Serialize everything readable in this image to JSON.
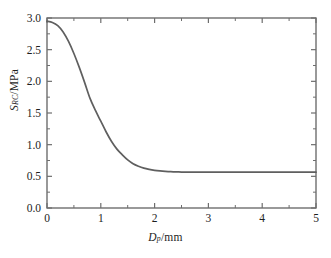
{
  "chart_data": {
    "type": "line",
    "title": "",
    "subtitle": "",
    "xlabel_symbol": "D",
    "xlabel_subscript": "p",
    "xlabel_unit": "/mm",
    "xlabel_full": "Dp/mm",
    "ylabel_symbol": "S",
    "ylabel_subscript": "RC",
    "ylabel_unit": "/MPa",
    "ylabel_full": "SRC/MPa",
    "xlim": [
      0,
      5
    ],
    "ylim": [
      0.0,
      3.0
    ],
    "xticks": [
      0,
      1,
      2,
      3,
      4,
      5
    ],
    "xtick_labels": [
      "0",
      "1",
      "2",
      "3",
      "4",
      "5"
    ],
    "xminor_ticks": [
      0.5,
      1.5,
      2.5,
      3.5,
      4.5
    ],
    "yticks": [
      0.0,
      0.5,
      1.0,
      1.5,
      2.0,
      2.5,
      3.0
    ],
    "ytick_labels": [
      "0.0",
      "0.5",
      "1.0",
      "1.5",
      "2.0",
      "2.5",
      "3.0"
    ],
    "yminor_ticks": [
      0.25,
      0.75,
      1.25,
      1.75,
      2.25,
      2.75
    ],
    "grid": false,
    "legend": null,
    "legend_position": "none",
    "frame": "box",
    "line_color": "#5f5f5f",
    "axis_color": "#6e6e6e",
    "series": [
      {
        "name": "SRC vs Dp",
        "color": "#5f5f5f",
        "x": [
          0.0,
          0.1,
          0.2,
          0.3,
          0.4,
          0.5,
          0.6,
          0.7,
          0.8,
          0.9,
          1.0,
          1.1,
          1.2,
          1.3,
          1.4,
          1.5,
          1.6,
          1.7,
          1.8,
          1.9,
          2.0,
          2.1,
          2.2,
          2.3,
          2.4,
          2.5,
          2.6,
          2.8,
          3.0,
          3.5,
          4.0,
          4.5,
          5.0
        ],
        "y": [
          2.95,
          2.93,
          2.88,
          2.78,
          2.63,
          2.44,
          2.22,
          1.98,
          1.73,
          1.54,
          1.37,
          1.2,
          1.05,
          0.93,
          0.84,
          0.76,
          0.7,
          0.66,
          0.63,
          0.61,
          0.595,
          0.585,
          0.578,
          0.573,
          0.57,
          0.568,
          0.567,
          0.566,
          0.566,
          0.566,
          0.566,
          0.566,
          0.566
        ]
      }
    ],
    "annotations": [],
    "notes": {
      "start_value": 2.95,
      "plateau_value": 0.566,
      "plateau_begins_at_x": 2.4
    }
  }
}
